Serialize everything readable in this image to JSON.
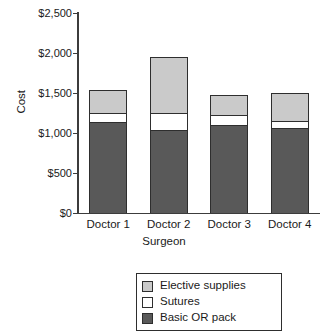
{
  "chart_data": {
    "type": "bar",
    "subtype": "stacked-bar",
    "title": "",
    "xlabel": "Surgeon",
    "ylabel": "Cost",
    "categories": [
      "Doctor 1",
      "Doctor 2",
      "Doctor 3",
      "Doctor 4"
    ],
    "series": [
      {
        "name": "Basic OR pack",
        "color": "#595959",
        "values": [
          1125,
          1025,
          1088,
          1050
        ]
      },
      {
        "name": "Sutures",
        "color": "#ffffff",
        "values": [
          125,
          225,
          137,
          100
        ]
      },
      {
        "name": "Elective supplies",
        "color": "#cacaca",
        "values": [
          287,
          700,
          250,
          350
        ]
      }
    ],
    "totals": [
      1537,
      1950,
      1475,
      1500
    ],
    "ylim": [
      0,
      2500
    ],
    "ytick_values": [
      0,
      500,
      1000,
      1500,
      2000,
      2500
    ],
    "ytick_labels": [
      "$0",
      "$500",
      "$1,000",
      "$1,500",
      "$2,000",
      "$2,500"
    ],
    "grid": false,
    "legend_position": "bottom-center",
    "legend_entries": [
      "Elective supplies",
      "Sutures",
      "Basic OR pack"
    ],
    "axis_color": "#3c3c3c",
    "background": "#ffffff"
  }
}
